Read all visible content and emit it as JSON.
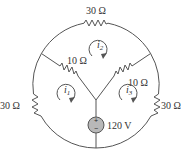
{
  "diagram": {
    "type": "circuit",
    "resistors": {
      "top": "30 Ω",
      "upper_left": "10 Ω",
      "upper_right": "10 Ω",
      "lower_left": "30 Ω",
      "lower_right": "30 Ω"
    },
    "source": {
      "label": "120 V",
      "plus": "+",
      "minus": "−",
      "fill_color": "#b8b8b8"
    },
    "mesh_currents": {
      "i1": {
        "symbol": "i",
        "sub": "1"
      },
      "i2": {
        "symbol": "i",
        "sub": "2"
      },
      "i3": {
        "symbol": "i",
        "sub": "3"
      }
    }
  }
}
